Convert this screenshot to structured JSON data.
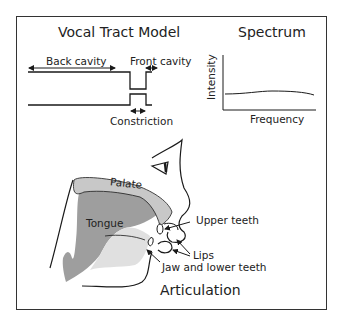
{
  "vocal_tract_model": {
    "title": "Vocal Tract Model",
    "labels": {
      "back_cavity": "Back cavity",
      "front_cavity": "Front cavity",
      "constriction": "Constriction"
    }
  },
  "spectrum": {
    "title": "Spectrum",
    "y_axis_label": "Intensity",
    "x_axis_label": "Frequency"
  },
  "articulation": {
    "title": "Articulation",
    "labels": {
      "palate": "Palate",
      "tongue": "Tongue",
      "upper_teeth": "Upper teeth",
      "lips": "Lips",
      "jaw_lower_teeth": "Jaw and lower teeth"
    },
    "colors": {
      "palate_fill": "#c8c8c8",
      "tongue_fill": "#9e9e9e",
      "jaw_fill": "#d9d9d9",
      "stroke": "#1a1a1a"
    }
  }
}
